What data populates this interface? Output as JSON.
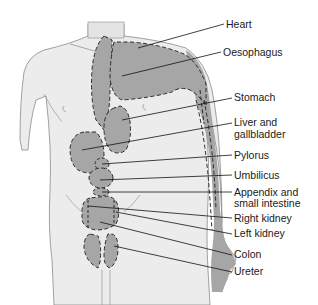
{
  "diagram": {
    "colors": {
      "background": "#ffffff",
      "skin": "#ececec",
      "outline": "#8a8a8a",
      "region": "#a6a6a6",
      "dash": "#2a2a2a",
      "leader": "#111111",
      "text": "#1a1a1a"
    },
    "labels": [
      {
        "id": "heart",
        "text": "Heart",
        "x": 226,
        "y": 19
      },
      {
        "id": "oesophagus",
        "text": "Oesophagus",
        "x": 223,
        "y": 47
      },
      {
        "id": "stomach",
        "text": "Stomach",
        "x": 234,
        "y": 92
      },
      {
        "id": "liver",
        "text": "Liver and",
        "text2": "gallbladder",
        "x": 234,
        "y": 117
      },
      {
        "id": "pylorus",
        "text": "Pylorus",
        "x": 234,
        "y": 150
      },
      {
        "id": "umbilicus",
        "text": "Umbilicus",
        "x": 234,
        "y": 170
      },
      {
        "id": "appendix",
        "text": "Appendix and",
        "text2": "small intestine",
        "x": 234,
        "y": 187
      },
      {
        "id": "right-kidney",
        "text": "Right kidney",
        "x": 234,
        "y": 213
      },
      {
        "id": "left-kidney",
        "text": "Left kidney",
        "x": 234,
        "y": 228
      },
      {
        "id": "colon",
        "text": "Colon",
        "x": 234,
        "y": 249
      },
      {
        "id": "ureter",
        "text": "Ureter",
        "x": 234,
        "y": 266
      }
    ]
  }
}
